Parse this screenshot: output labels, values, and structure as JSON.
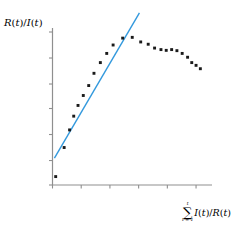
{
  "figure": {
    "background": "#ffffff",
    "axis_color": "#8f8f8f",
    "marker_color": "#1a1a1a",
    "line_color": "#3399dd"
  },
  "labels": {
    "y_axis": "R(t)/I(t)",
    "y_axis_parts": {
      "num_fn": "R",
      "num_var": "t",
      "den_fn": "I",
      "den_var": "t"
    },
    "x_axis": "∑ I(t)/R(t)",
    "x_axis_parts": {
      "sum_symbol": "∑",
      "sum_upper": "t",
      "sum_lower": "t = 1",
      "num_fn": "I",
      "num_var": "t",
      "den_fn": "R",
      "den_var": "t"
    }
  },
  "chart_data": {
    "type": "scatter",
    "title": "",
    "xlabel": "∑ I(t)/R(t)",
    "ylabel": "R(t)/I(t)",
    "xlim": [
      0,
      1
    ],
    "ylim": [
      0,
      1
    ],
    "grid": false,
    "legend": null,
    "axis_ticks_labeled": false,
    "x_ticks": [
      0.0,
      0.18,
      0.36,
      0.54,
      0.72,
      0.9
    ],
    "y_ticks": [
      0.0,
      0.16,
      0.33,
      0.5,
      0.66,
      0.83,
      1.0
    ],
    "series": [
      {
        "name": "observations",
        "type": "scatter",
        "marker": "square",
        "color": "#1a1a1a",
        "points": [
          [
            0.02,
            0.055
          ],
          [
            0.073,
            0.245
          ],
          [
            0.107,
            0.36
          ],
          [
            0.133,
            0.45
          ],
          [
            0.16,
            0.52
          ],
          [
            0.193,
            0.585
          ],
          [
            0.227,
            0.65
          ],
          [
            0.26,
            0.73
          ],
          [
            0.3,
            0.8
          ],
          [
            0.34,
            0.86
          ],
          [
            0.38,
            0.915
          ],
          [
            0.44,
            0.96
          ],
          [
            0.5,
            0.965
          ],
          [
            0.553,
            0.935
          ],
          [
            0.6,
            0.92
          ],
          [
            0.64,
            0.895
          ],
          [
            0.68,
            0.885
          ],
          [
            0.713,
            0.88
          ],
          [
            0.747,
            0.885
          ],
          [
            0.78,
            0.878
          ],
          [
            0.813,
            0.86
          ],
          [
            0.847,
            0.835
          ],
          [
            0.873,
            0.8
          ],
          [
            0.9,
            0.782
          ],
          [
            0.927,
            0.76
          ]
        ]
      },
      {
        "name": "linear-fit",
        "type": "line",
        "color": "#3399dd",
        "x_from": 0.012,
        "y_from": 0.175,
        "x_to": 0.545,
        "y_to": 1.125
      }
    ]
  }
}
